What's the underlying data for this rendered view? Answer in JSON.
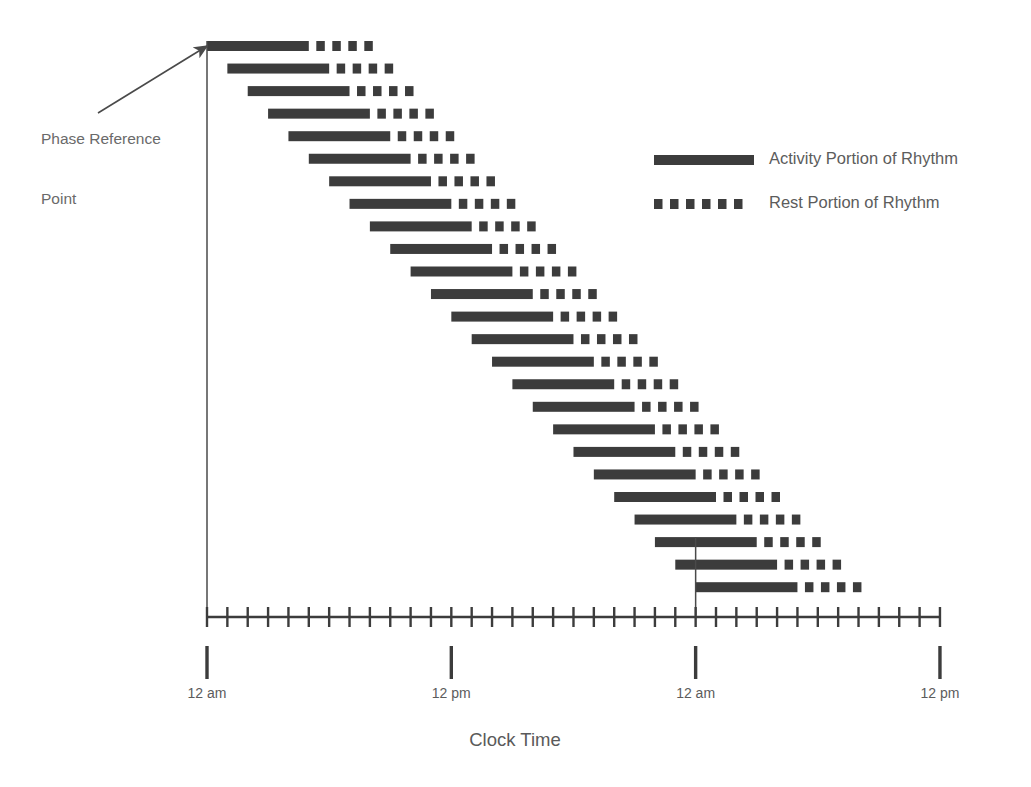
{
  "figure": {
    "type": "actogram",
    "background_color": "#ffffff",
    "mark_color": "#3c3c3c",
    "line_color": "#4a4a4a",
    "text_color": "#5a5a5a"
  },
  "annotations": {
    "phase_reference": {
      "label_line_1": "Phase Reference",
      "label_line_2": "Point",
      "label_full": "Phase Reference Point"
    }
  },
  "legend": {
    "items": [
      {
        "label": "Activity Portion of Rhythm",
        "style": "solid",
        "color": "#3c3c3c"
      },
      {
        "label": "Rest Portion of Rhythm",
        "style": "dashed",
        "color": "#3c3c3c"
      }
    ]
  },
  "axis": {
    "title": "Clock Time",
    "major_labels": [
      "12 am",
      "12 pm",
      "12 am",
      "12 pm"
    ],
    "major_positions_hours": [
      0,
      12,
      24,
      36
    ],
    "minor_tick_interval_hours": 1,
    "range_hours": [
      0,
      36
    ],
    "total_minor_ticks": 37
  },
  "chart_data": {
    "type": "bar",
    "title": "",
    "subtitle": "",
    "xlabel": "Clock Time",
    "ylabel": "",
    "xlim": [
      0,
      36
    ],
    "grid": false,
    "legend_position": "right",
    "x_tick_labels": [
      "12 am",
      "12 pm",
      "12 am",
      "12 pm"
    ],
    "x_tick_values": [
      0,
      12,
      24,
      36
    ],
    "series": [
      {
        "name": "Activity Portion of Rhythm",
        "style": "solid"
      },
      {
        "name": "Rest Portion of Rhythm",
        "style": "dashed"
      }
    ],
    "day_period_hours": 25,
    "activity_duration_hours": 5,
    "rest_duration_hours": 8.5,
    "onset_delay_per_day_hours": 1,
    "rows": [
      {
        "day": 1,
        "onset_hour": 0,
        "activity_end_hour": 5,
        "rest_end_hour": 8.5
      },
      {
        "day": 2,
        "onset_hour": 1,
        "activity_end_hour": 6,
        "rest_end_hour": 9.5
      },
      {
        "day": 3,
        "onset_hour": 2,
        "activity_end_hour": 7,
        "rest_end_hour": 10.5
      },
      {
        "day": 4,
        "onset_hour": 3,
        "activity_end_hour": 8,
        "rest_end_hour": 11.5
      },
      {
        "day": 5,
        "onset_hour": 4,
        "activity_end_hour": 9,
        "rest_end_hour": 12.5
      },
      {
        "day": 6,
        "onset_hour": 5,
        "activity_end_hour": 10,
        "rest_end_hour": 13.5
      },
      {
        "day": 7,
        "onset_hour": 6,
        "activity_end_hour": 11,
        "rest_end_hour": 14.5
      },
      {
        "day": 8,
        "onset_hour": 7,
        "activity_end_hour": 12,
        "rest_end_hour": 15.5
      },
      {
        "day": 9,
        "onset_hour": 8,
        "activity_end_hour": 13,
        "rest_end_hour": 16.5
      },
      {
        "day": 10,
        "onset_hour": 9,
        "activity_end_hour": 14,
        "rest_end_hour": 17.5
      },
      {
        "day": 11,
        "onset_hour": 10,
        "activity_end_hour": 15,
        "rest_end_hour": 18.5
      },
      {
        "day": 12,
        "onset_hour": 11,
        "activity_end_hour": 16,
        "rest_end_hour": 19.5
      },
      {
        "day": 13,
        "onset_hour": 12,
        "activity_end_hour": 17,
        "rest_end_hour": 20.5
      },
      {
        "day": 14,
        "onset_hour": 13,
        "activity_end_hour": 18,
        "rest_end_hour": 21.5
      },
      {
        "day": 15,
        "onset_hour": 14,
        "activity_end_hour": 19,
        "rest_end_hour": 22.5
      },
      {
        "day": 16,
        "onset_hour": 15,
        "activity_end_hour": 20,
        "rest_end_hour": 23.5
      },
      {
        "day": 17,
        "onset_hour": 16,
        "activity_end_hour": 21,
        "rest_end_hour": 24.5
      },
      {
        "day": 18,
        "onset_hour": 17,
        "activity_end_hour": 22,
        "rest_end_hour": 25.5
      },
      {
        "day": 19,
        "onset_hour": 18,
        "activity_end_hour": 23,
        "rest_end_hour": 26.5
      },
      {
        "day": 20,
        "onset_hour": 19,
        "activity_end_hour": 24,
        "rest_end_hour": 27.5
      },
      {
        "day": 21,
        "onset_hour": 20,
        "activity_end_hour": 25,
        "rest_end_hour": 28.5
      },
      {
        "day": 22,
        "onset_hour": 21,
        "activity_end_hour": 26,
        "rest_end_hour": 29.5
      },
      {
        "day": 23,
        "onset_hour": 22,
        "activity_end_hour": 27,
        "rest_end_hour": 30.5
      },
      {
        "day": 24,
        "onset_hour": 23,
        "activity_end_hour": 28,
        "rest_end_hour": 31.5
      },
      {
        "day": 25,
        "onset_hour": 24,
        "activity_end_hour": 29,
        "rest_end_hour": 32.5
      }
    ],
    "reference_lines": [
      {
        "name": "phase-reference-line-start",
        "at_hour": 0,
        "from_day": 1,
        "to_axis": true
      },
      {
        "name": "phase-reference-line-second-cycle",
        "at_hour": 24,
        "from_day": 23,
        "to_axis": true
      }
    ]
  }
}
